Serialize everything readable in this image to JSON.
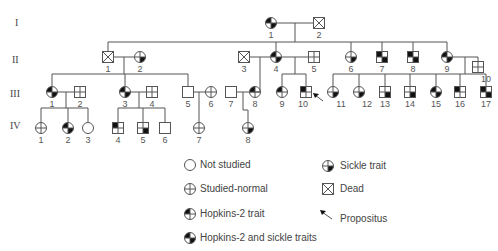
{
  "generations": [
    "I",
    "II",
    "III",
    "IV"
  ],
  "colors": {
    "line": "#555555",
    "fill": "#111111"
  },
  "individuals": {
    "I": [
      {
        "id": "1",
        "sex": "female",
        "status": "hopkins2-and-sickle"
      },
      {
        "id": "2",
        "sex": "male",
        "status": "dead"
      }
    ],
    "II": [
      {
        "id": "1",
        "sex": "male",
        "status": "dead"
      },
      {
        "id": "2",
        "sex": "female",
        "status": "sickle-trait"
      },
      {
        "id": "3",
        "sex": "male",
        "status": "dead"
      },
      {
        "id": "4",
        "sex": "female",
        "status": "hopkins2-and-sickle"
      },
      {
        "id": "5",
        "sex": "male",
        "status": "studied-normal"
      },
      {
        "id": "6",
        "sex": "female",
        "status": "sickle-trait"
      },
      {
        "id": "7",
        "sex": "male",
        "status": "hopkins2-and-sickle"
      },
      {
        "id": "8",
        "sex": "male",
        "status": "hopkins2-and-sickle"
      },
      {
        "id": "9",
        "sex": "female",
        "status": "hopkins2-and-sickle"
      },
      {
        "id": "10",
        "sex": "male",
        "status": "studied-normal"
      }
    ],
    "III": [
      {
        "id": "1",
        "sex": "female",
        "status": "hopkins2-and-sickle"
      },
      {
        "id": "2",
        "sex": "male",
        "status": "studied-normal"
      },
      {
        "id": "3",
        "sex": "female",
        "status": "hopkins2-and-sickle"
      },
      {
        "id": "4",
        "sex": "male",
        "status": "studied-normal"
      },
      {
        "id": "5",
        "sex": "male",
        "status": "not-studied"
      },
      {
        "id": "6",
        "sex": "female",
        "status": "studied-normal"
      },
      {
        "id": "7",
        "sex": "male",
        "status": "not-studied"
      },
      {
        "id": "8",
        "sex": "female",
        "status": "hopkins2-trait"
      },
      {
        "id": "9",
        "sex": "female",
        "status": "hopkins2-trait"
      },
      {
        "id": "10",
        "sex": "male",
        "status": "hopkins2-trait",
        "propositus": true
      },
      {
        "id": "11",
        "sex": "female",
        "status": "sickle-trait"
      },
      {
        "id": "12",
        "sex": "female",
        "status": "sickle-trait"
      },
      {
        "id": "13",
        "sex": "male",
        "status": "sickle-trait"
      },
      {
        "id": "14",
        "sex": "male",
        "status": "sickle-trait"
      },
      {
        "id": "15",
        "sex": "female",
        "status": "hopkins2-and-sickle"
      },
      {
        "id": "16",
        "sex": "male",
        "status": "hopkins2-trait"
      },
      {
        "id": "17",
        "sex": "male",
        "status": "hopkins2-and-sickle"
      }
    ],
    "IV": [
      {
        "id": "1",
        "sex": "female",
        "status": "studied-normal"
      },
      {
        "id": "2",
        "sex": "female",
        "status": "hopkins2-and-sickle"
      },
      {
        "id": "3",
        "sex": "female",
        "status": "not-studied"
      },
      {
        "id": "4",
        "sex": "male",
        "status": "hopkins2-trait"
      },
      {
        "id": "5",
        "sex": "male",
        "status": "sickle-trait"
      },
      {
        "id": "6",
        "sex": "male",
        "status": "not-studied"
      },
      {
        "id": "7",
        "sex": "female",
        "status": "studied-normal"
      },
      {
        "id": "8",
        "sex": "female",
        "status": "sickle-trait"
      }
    ]
  },
  "legend": [
    {
      "key": "not-studied",
      "label": "Not studied"
    },
    {
      "key": "studied-normal",
      "label": "Studied-normal"
    },
    {
      "key": "hopkins2-trait",
      "label": "Hopkins-2 trait"
    },
    {
      "key": "hopkins2-and-sickle",
      "label": "Hopkins-2 and sickle traits"
    },
    {
      "key": "sickle-trait",
      "label": "Sickle trait"
    },
    {
      "key": "dead",
      "label": "Dead"
    },
    {
      "key": "propositus",
      "label": "Propositus"
    }
  ]
}
